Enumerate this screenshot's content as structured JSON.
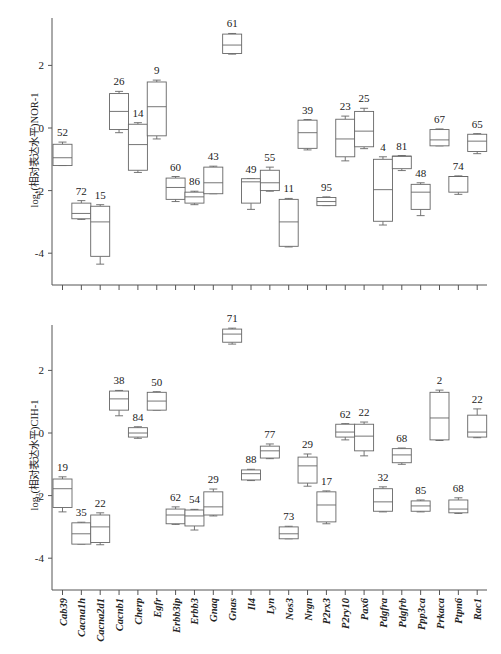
{
  "chart_data": [
    {
      "type": "box",
      "panel": "top",
      "ylabel": "log₂(相对表达水平)NOR-1",
      "ylim": [
        -5,
        3.5
      ],
      "yticks": [
        2,
        0,
        -2,
        -4
      ],
      "categories": [
        "Cab39",
        "Cacna1h",
        "Cacna2d1",
        "Cacnb1",
        "Cherp",
        "Egfr",
        "Erbb3ip",
        "Erbb3",
        "Gnaq",
        "Gnas",
        "Il4",
        "Lyn",
        "Nos3",
        "Nrgn",
        "P2rx3",
        "P2ry10",
        "Pax6",
        "Pdgfra",
        "Pdgfrb",
        "Ppp3ca",
        "Prkaca",
        "Ptpn6",
        "Rac1"
      ],
      "boxes": [
        {
          "label": "52",
          "wmax": -0.45,
          "q3": -0.52,
          "median": -0.95,
          "q1": -1.2,
          "wmin": -1.2
        },
        {
          "label": "72",
          "wmax": -2.32,
          "q3": -2.4,
          "median": -2.73,
          "q1": -2.9,
          "wmin": -2.92
        },
        {
          "label": "15",
          "wmax": -2.45,
          "q3": -2.5,
          "median": -3.0,
          "q1": -4.1,
          "wmin": -4.35
        },
        {
          "label": "26",
          "wmax": 1.17,
          "q3": 1.1,
          "median": 0.53,
          "q1": -0.05,
          "wmin": -0.15
        },
        {
          "label": "14",
          "wmax": 0.17,
          "q3": 0.12,
          "median": -0.53,
          "q1": -1.35,
          "wmin": -1.42
        },
        {
          "label": "9",
          "wmax": 1.53,
          "q3": 1.47,
          "median": 0.68,
          "q1": -0.25,
          "wmin": -0.35
        },
        {
          "label": "60",
          "wmax": -1.55,
          "q3": -1.6,
          "median": -1.9,
          "q1": -2.28,
          "wmin": -2.35
        },
        {
          "label": "86",
          "wmax": -2.02,
          "q3": -2.05,
          "median": -2.2,
          "q1": -2.4,
          "wmin": -2.45
        },
        {
          "label": "43",
          "wmax": -1.22,
          "q3": -1.25,
          "median": -1.75,
          "q1": -2.1,
          "wmin": -2.1
        },
        {
          "label": "61",
          "wmax": 3.02,
          "q3": 3.0,
          "median": 2.65,
          "q1": 2.38,
          "wmin": 2.36
        },
        {
          "label": "49",
          "wmax": -1.62,
          "q3": -1.62,
          "median": -1.72,
          "q1": -2.4,
          "wmin": -2.6
        },
        {
          "label": "55",
          "wmax": -1.25,
          "q3": -1.35,
          "median": -1.75,
          "q1": -2.0,
          "wmin": -2.02
        },
        {
          "label": "11",
          "wmax": -2.25,
          "q3": -2.28,
          "median": -3.0,
          "q1": -3.78,
          "wmin": -3.8
        },
        {
          "label": "39",
          "wmax": 0.27,
          "q3": 0.25,
          "median": -0.15,
          "q1": -0.65,
          "wmin": -0.7
        },
        {
          "label": "95",
          "wmax": -2.2,
          "q3": -2.22,
          "median": -2.35,
          "q1": -2.48,
          "wmin": -2.48
        },
        {
          "label": "23",
          "wmax": 0.38,
          "q3": 0.28,
          "median": -0.35,
          "q1": -0.92,
          "wmin": -1.05
        },
        {
          "label": "25",
          "wmax": 0.63,
          "q3": 0.53,
          "median": -0.1,
          "q1": -0.6,
          "wmin": -0.66
        },
        {
          "label": "4",
          "wmax": -0.92,
          "q3": -1.0,
          "median": -1.97,
          "q1": -2.98,
          "wmin": -3.1
        },
        {
          "label": "81",
          "wmax": -0.88,
          "q3": -0.9,
          "median": -0.9,
          "q1": -1.3,
          "wmin": -1.36
        },
        {
          "label": "48",
          "wmax": -1.75,
          "q3": -1.8,
          "median": -2.05,
          "q1": -2.6,
          "wmin": -2.8
        },
        {
          "label": "67",
          "wmax": -0.03,
          "q3": -0.05,
          "median": -0.38,
          "q1": -0.57,
          "wmin": -0.57
        },
        {
          "label": "74",
          "wmax": -1.53,
          "q3": -1.55,
          "median": -1.55,
          "q1": -2.05,
          "wmin": -2.12
        },
        {
          "label": "65",
          "wmax": -0.18,
          "q3": -0.2,
          "median": -0.42,
          "q1": -0.75,
          "wmin": -0.82
        }
      ]
    },
    {
      "type": "box",
      "panel": "bottom",
      "ylabel": "log₂(相对表达水平)CIH-1",
      "ylim": [
        -5,
        3.5
      ],
      "yticks": [
        2,
        0,
        -2,
        -4
      ],
      "categories": [
        "Cab39",
        "Cacna1h",
        "Cacna2d1",
        "Cacnb1",
        "Cherp",
        "Egfr",
        "Erbb3ip",
        "Erbb3",
        "Gnaq",
        "Gnas",
        "Il4",
        "Lyn",
        "Nos3",
        "Nrgn",
        "P2rx3",
        "P2ry10",
        "Pax6",
        "Pdgfra",
        "Pdgfrb",
        "Ppp3ca",
        "Prkaca",
        "Ptpn6",
        "Rac1"
      ],
      "boxes": [
        {
          "label": "19",
          "wmax": -1.4,
          "q3": -1.47,
          "median": -1.78,
          "q1": -2.38,
          "wmin": -2.52
        },
        {
          "label": "35",
          "wmax": -2.85,
          "q3": -2.87,
          "median": -3.22,
          "q1": -3.55,
          "wmin": -3.55
        },
        {
          "label": "22",
          "wmax": -2.55,
          "q3": -2.62,
          "median": -3.0,
          "q1": -3.5,
          "wmin": -3.57
        },
        {
          "label": "38",
          "wmax": 1.36,
          "q3": 1.34,
          "median": 1.09,
          "q1": 0.73,
          "wmin": 0.55
        },
        {
          "label": "84",
          "wmax": 0.2,
          "q3": 0.17,
          "median": 0.0,
          "q1": -0.13,
          "wmin": -0.17
        },
        {
          "label": "50",
          "wmax": 1.32,
          "q3": 1.3,
          "median": 1.02,
          "q1": 0.73,
          "wmin": 0.73
        },
        {
          "label": "62",
          "wmax": -2.36,
          "q3": -2.43,
          "median": -2.62,
          "q1": -2.9,
          "wmin": -2.92
        },
        {
          "label": "54",
          "wmax": -2.44,
          "q3": -2.46,
          "median": -2.65,
          "q1": -2.97,
          "wmin": -3.1
        },
        {
          "label": "29",
          "wmax": -1.79,
          "q3": -1.88,
          "median": -2.36,
          "q1": -2.62,
          "wmin": -2.65
        },
        {
          "label": "71",
          "wmax": 3.35,
          "q3": 3.32,
          "median": 3.16,
          "q1": 2.9,
          "wmin": 2.84
        },
        {
          "label": "88",
          "wmax": -1.16,
          "q3": -1.18,
          "median": -1.3,
          "q1": -1.5,
          "wmin": -1.52
        },
        {
          "label": "77",
          "wmax": -0.35,
          "q3": -0.42,
          "median": -0.57,
          "q1": -0.8,
          "wmin": -0.82
        },
        {
          "label": "73",
          "wmax": -2.98,
          "q3": -3.0,
          "median": -3.22,
          "q1": -3.38,
          "wmin": -3.38
        },
        {
          "label": "29",
          "wmax": -0.67,
          "q3": -0.77,
          "median": -1.05,
          "q1": -1.6,
          "wmin": -1.7
        },
        {
          "label": "17",
          "wmax": -1.85,
          "q3": -1.88,
          "median": -2.3,
          "q1": -2.84,
          "wmin": -2.9
        },
        {
          "label": "62",
          "wmax": 0.3,
          "q3": 0.28,
          "median": 0.03,
          "q1": -0.13,
          "wmin": -0.22
        },
        {
          "label": "22",
          "wmax": 0.35,
          "q3": 0.28,
          "median": -0.1,
          "q1": -0.57,
          "wmin": -0.73
        },
        {
          "label": "32",
          "wmax": -1.72,
          "q3": -1.78,
          "median": -2.2,
          "q1": -2.5,
          "wmin": -2.52
        },
        {
          "label": "68",
          "wmax": -0.48,
          "q3": -0.5,
          "median": -0.7,
          "q1": -0.95,
          "wmin": -1.0
        },
        {
          "label": "85",
          "wmax": -2.14,
          "q3": -2.17,
          "median": -2.33,
          "q1": -2.5,
          "wmin": -2.52
        },
        {
          "label": "2",
          "wmax": 1.37,
          "q3": 1.3,
          "median": 0.48,
          "q1": -0.22,
          "wmin": -0.24
        },
        {
          "label": "68",
          "wmax": -2.07,
          "q3": -2.14,
          "median": -2.43,
          "q1": -2.55,
          "wmin": -2.57
        },
        {
          "label": "22",
          "wmax": 0.77,
          "q3": 0.57,
          "median": 0.03,
          "q1": -0.13,
          "wmin": -0.15
        }
      ]
    }
  ]
}
